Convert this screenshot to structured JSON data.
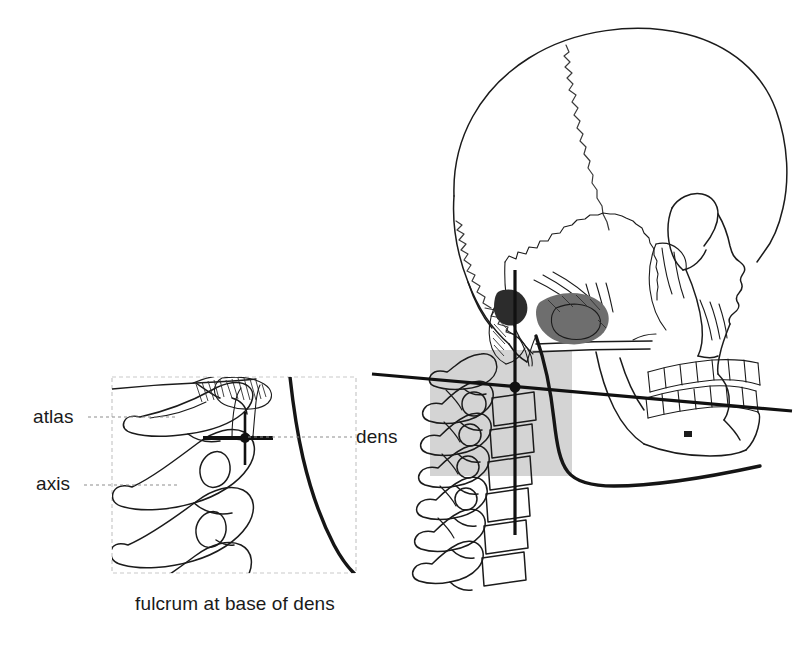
{
  "figure": {
    "caption": "fulcrum at base of dens",
    "background_color": "#ffffff",
    "ink_color": "#1b1b1b",
    "highlight_color": "#d9d9d9",
    "leader_color": "#8d8d8d"
  },
  "labels": {
    "atlas": "atlas",
    "axis": "axis",
    "dens": "dens"
  },
  "inset": {
    "name": "magnified upper cervical detail",
    "border_style": "dashed light gray",
    "contents": "atlas, axis and dens in lateral view with fulcrum cross marker"
  },
  "markers": {
    "fulcrum": "fulcrum cross marker at base of dens",
    "plumb_line": "vertical gravity line through skull and cervical spine",
    "horizontal_reference": "horizontal reference line through fulcrum and occlusal plane"
  },
  "regions": {
    "highlight_box": "gray shaded region over upper cervical vertebrae"
  }
}
